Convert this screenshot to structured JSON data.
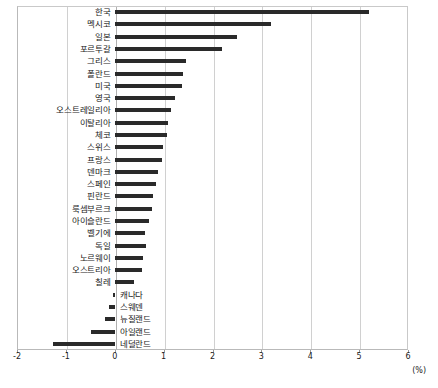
{
  "chart_data": {
    "type": "bar",
    "orientation": "horizontal",
    "title": "",
    "subtitle": "",
    "xlabel": "(%)",
    "ylabel": "",
    "unit": "(%)",
    "xlim": [
      -2,
      6
    ],
    "xticks": [
      -2,
      -1,
      0,
      1,
      2,
      3,
      4,
      5,
      6
    ],
    "xtick_labels": [
      "-2",
      "-1",
      "0",
      "1",
      "2",
      "3",
      "4",
      "5",
      "6"
    ],
    "grid": true,
    "grid_axis": "x",
    "legend": false,
    "legend_position": "none",
    "bar_color": "#2a2a2a",
    "categories": [
      "한국",
      "멕시코",
      "일본",
      "포르투갈",
      "그리스",
      "폴란드",
      "미국",
      "영국",
      "오스트레일리아",
      "이탈리아",
      "체코",
      "스위스",
      "프랑스",
      "덴마크",
      "스페인",
      "핀란드",
      "룩셈부르크",
      "아이슬란드",
      "벨기에",
      "독일",
      "노르웨이",
      "오스트리아",
      "칠레",
      "캐나다",
      "스웨덴",
      "뉴질랜드",
      "아일랜드",
      "네덜란드"
    ],
    "values": [
      5.2,
      3.2,
      2.5,
      2.2,
      1.45,
      1.4,
      1.38,
      1.23,
      1.15,
      1.08,
      1.06,
      0.98,
      0.97,
      0.89,
      0.85,
      0.78,
      0.77,
      0.7,
      0.62,
      0.63,
      0.57,
      0.55,
      0.4,
      -0.04,
      -0.11,
      -0.2,
      -0.49,
      -1.27
    ]
  },
  "axis": {
    "unit_label": "(%)"
  }
}
